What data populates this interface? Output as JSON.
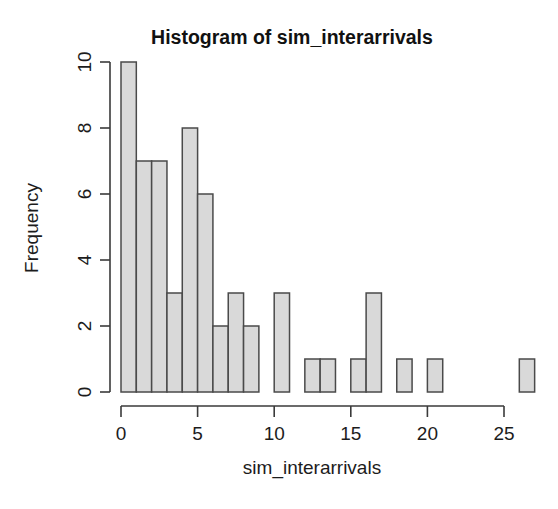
{
  "chart_data": {
    "type": "bar",
    "title": "Histogram of sim_interarrivals",
    "xlabel": "sim_interarrivals",
    "ylabel": "Frequency",
    "grid": false,
    "legend": null,
    "xlim": [
      0,
      27
    ],
    "ylim": [
      0,
      10
    ],
    "xticks": [
      0,
      5,
      10,
      15,
      20,
      25
    ],
    "xtick_labels": [
      "0",
      "5",
      "10",
      "15",
      "20",
      "25"
    ],
    "yticks": [
      0,
      2,
      4,
      6,
      8,
      10
    ],
    "ytick_labels": [
      "0",
      "2",
      "4",
      "6",
      "8",
      "10"
    ],
    "bin_width": 1,
    "bin_edges": [
      0,
      1,
      2,
      3,
      4,
      5,
      6,
      7,
      8,
      9,
      10,
      11,
      12,
      13,
      14,
      15,
      16,
      17,
      18,
      19,
      20,
      21,
      22,
      23,
      24,
      25,
      26,
      27
    ],
    "categories": [
      "0-1",
      "1-2",
      "2-3",
      "3-4",
      "4-5",
      "5-6",
      "6-7",
      "7-8",
      "8-9",
      "9-10",
      "10-11",
      "11-12",
      "12-13",
      "13-14",
      "14-15",
      "15-16",
      "16-17",
      "17-18",
      "18-19",
      "19-20",
      "20-21",
      "21-22",
      "22-23",
      "23-24",
      "24-25",
      "25-26",
      "26-27"
    ],
    "values": [
      10,
      7,
      7,
      3,
      8,
      6,
      2,
      3,
      2,
      0,
      3,
      0,
      1,
      1,
      0,
      1,
      3,
      0,
      1,
      0,
      1,
      0,
      0,
      0,
      0,
      0,
      1
    ],
    "bar_fill_color": "#d9d9d9",
    "bar_border_color": "#4a4a4a",
    "axis_color": "#3a3a3a",
    "background_color": "#ffffff"
  }
}
